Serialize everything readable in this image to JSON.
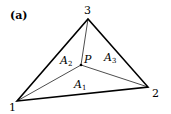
{
  "figure": {
    "panel_label": "(a)",
    "vertices": [
      {
        "id": "1",
        "label": "1",
        "x": 17,
        "y": 101
      },
      {
        "id": "2",
        "label": "2",
        "x": 148,
        "y": 87
      },
      {
        "id": "3",
        "label": "3",
        "x": 88,
        "y": 19
      }
    ],
    "interior_point": {
      "label": "P",
      "x": 81,
      "y": 65
    },
    "areas": [
      {
        "label": "A",
        "sub": "1"
      },
      {
        "label": "A",
        "sub": "2"
      },
      {
        "label": "A",
        "sub": "3"
      }
    ]
  }
}
